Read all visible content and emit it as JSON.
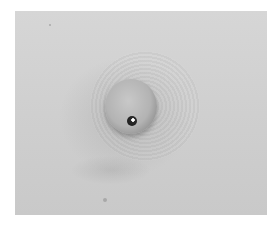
{
  "image": {
    "description": "Grayscale clinical photograph of a round raised skin nodule with a small dark central spot, surrounded by a concentric darker halo on pale skin",
    "colors": {
      "background": "#ffffff",
      "skin": "#d2d2d2",
      "nodule": "#b3b3b3",
      "spot": "#1a1a1a"
    }
  }
}
